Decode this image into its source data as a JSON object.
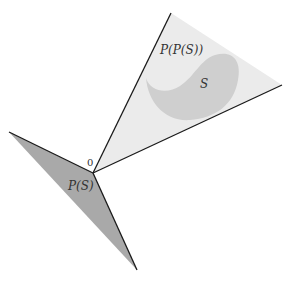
{
  "diagram": {
    "labels": {
      "origin": "0",
      "set": "S",
      "polar": "P(S)",
      "bipolar": "P(P(S))"
    },
    "colors": {
      "background": "#ffffff",
      "bipolar_fill": "#ebebeb",
      "set_fill": "#cfcfcf",
      "polar_fill": "#a9a9a9",
      "edge": "#1a1a1a"
    }
  }
}
